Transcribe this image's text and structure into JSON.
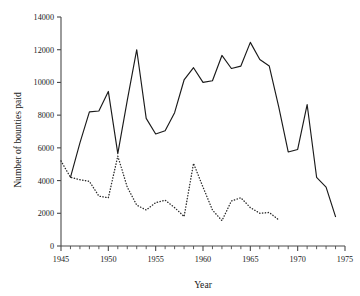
{
  "chart_data": {
    "type": "line",
    "title": "",
    "subtitle": "",
    "xlabel": "Year",
    "ylabel": "Number of bounties paid",
    "xlim": [
      1945,
      1975
    ],
    "ylim": [
      0,
      14000
    ],
    "grid": false,
    "legend": "none",
    "x_ticks_major": [
      1945,
      1950,
      1955,
      1960,
      1965,
      1970,
      1975
    ],
    "x_tick_labels": [
      "1945",
      "1950",
      "1955",
      "1960",
      "1965",
      "1970",
      "1975"
    ],
    "x_tick_minor_step": 1,
    "y_ticks": [
      0,
      2000,
      4000,
      6000,
      8000,
      10000,
      12000,
      14000
    ],
    "y_tick_labels": [
      "0",
      "2000",
      "4000",
      "6000",
      "8000",
      "10000",
      "12000",
      "14000"
    ],
    "series": [
      {
        "name": "solid-series",
        "style": "solid",
        "color": "#1a1a1a",
        "x": [
          1946,
          1947,
          1948,
          1949,
          1950,
          1951,
          1952,
          1953,
          1954,
          1955,
          1956,
          1957,
          1958,
          1959,
          1960,
          1961,
          1962,
          1963,
          1964,
          1965,
          1966,
          1967,
          1968,
          1969,
          1970,
          1971,
          1972,
          1973,
          1974
        ],
        "values": [
          4200,
          6300,
          8200,
          8250,
          9450,
          5650,
          8900,
          12000,
          7800,
          6850,
          7050,
          8150,
          10150,
          10900,
          10000,
          10100,
          11650,
          10850,
          11000,
          12450,
          11400,
          11000,
          8500,
          5750,
          5900,
          8650,
          4200,
          3600,
          1800
        ]
      },
      {
        "name": "dotted-series",
        "style": "dotted",
        "color": "#2a2a2a",
        "x": [
          1945,
          1946,
          1947,
          1948,
          1949,
          1950,
          1951,
          1952,
          1953,
          1954,
          1955,
          1956,
          1957,
          1958,
          1959,
          1960,
          1961,
          1962,
          1963,
          1964,
          1965,
          1966,
          1967,
          1968
        ],
        "values": [
          5200,
          4200,
          4050,
          3950,
          3050,
          2950,
          5500,
          3600,
          2500,
          2200,
          2650,
          2800,
          2350,
          1800,
          5050,
          3600,
          2200,
          1550,
          2750,
          2950,
          2350,
          2000,
          2050,
          1600
        ]
      }
    ]
  }
}
